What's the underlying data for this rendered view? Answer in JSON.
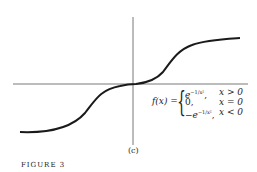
{
  "figure": {
    "panel_label": "(c)",
    "caption": "FIGURE 3",
    "formula": {
      "lhs": "f(x) =",
      "cases": [
        {
          "expr": "e",
          "sup": "−1/x²",
          "sep": ",",
          "cond": "x > 0"
        },
        {
          "expr": "0,",
          "sup": "",
          "sep": "",
          "cond": "x = 0"
        },
        {
          "expr": "−e",
          "sup": "−1/x²",
          "sep": ",",
          "cond": "x < 0"
        }
      ]
    },
    "colors": {
      "curve": "#1a1a1a",
      "axis": "#555555"
    }
  }
}
